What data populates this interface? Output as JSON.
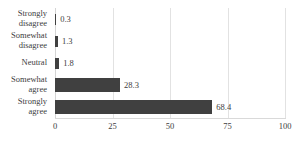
{
  "chart_data": {
    "type": "bar",
    "orientation": "horizontal",
    "title": "",
    "xlabel": "",
    "ylabel": "",
    "categories": [
      "Strongly disagree",
      "Somewhat disagree",
      "Neutral",
      "Somewhat agree",
      "Strongly agree"
    ],
    "values": [
      0.3,
      1.3,
      1.8,
      28.3,
      68.4
    ],
    "value_labels": [
      "0.3",
      "1.3",
      "1.8",
      "28.3",
      "68.4"
    ],
    "xlim": [
      0,
      100
    ],
    "xticks": [
      0,
      25,
      50,
      75,
      100
    ],
    "xtick_labels": [
      "0",
      "25",
      "50",
      "75",
      "100"
    ],
    "grid": true,
    "grid_axis": "x",
    "legend": false,
    "series": [
      {
        "name": "",
        "values": [
          0.3,
          1.3,
          1.8,
          28.3,
          68.4
        ],
        "color": "#404040"
      }
    ],
    "colors": {
      "bar": "#404040",
      "gridline": "#e2e2e2",
      "axis": "#d9d9d9",
      "text": "#3d3d3d",
      "background": "#ffffff"
    }
  }
}
